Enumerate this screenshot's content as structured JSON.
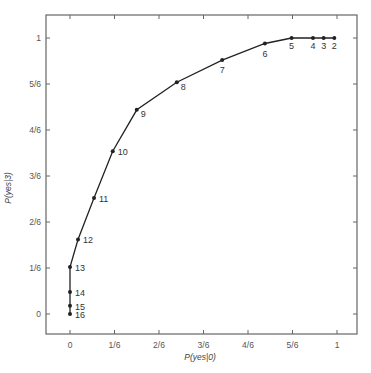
{
  "chart_data": {
    "type": "line",
    "title": "",
    "xlabel": "P(yes|0)",
    "ylabel": "P(yes|3)",
    "xlim": [
      -0.16,
      1.08
    ],
    "ylim": [
      -0.14,
      1.1
    ],
    "grid": false,
    "legend": null,
    "x_ticks": [
      {
        "value": 0,
        "label": "0"
      },
      {
        "value": 0.1667,
        "label": "1/6"
      },
      {
        "value": 0.3333,
        "label": "2/6"
      },
      {
        "value": 0.5,
        "label": "3/6"
      },
      {
        "value": 0.6667,
        "label": "4/6"
      },
      {
        "value": 0.8333,
        "label": "5/6"
      },
      {
        "value": 1,
        "label": "1"
      }
    ],
    "y_ticks": [
      {
        "value": 0,
        "label": "0"
      },
      {
        "value": 0.1667,
        "label": "1/6"
      },
      {
        "value": 0.3333,
        "label": "2/6"
      },
      {
        "value": 0.5,
        "label": "3/6"
      },
      {
        "value": 0.6667,
        "label": "4/6"
      },
      {
        "value": 0.8333,
        "label": "5/6"
      },
      {
        "value": 1,
        "label": "1"
      }
    ],
    "series": [
      {
        "name": "ROC",
        "points": [
          {
            "label": "2",
            "x": 0.99,
            "y": 1.0
          },
          {
            "label": "3",
            "x": 0.95,
            "y": 1.0
          },
          {
            "label": "4",
            "x": 0.91,
            "y": 1.0
          },
          {
            "label": "5",
            "x": 0.83,
            "y": 1.0
          },
          {
            "label": "6",
            "x": 0.73,
            "y": 0.98
          },
          {
            "label": "7",
            "x": 0.57,
            "y": 0.92
          },
          {
            "label": "8",
            "x": 0.4,
            "y": 0.84
          },
          {
            "label": "9",
            "x": 0.25,
            "y": 0.74
          },
          {
            "label": "10",
            "x": 0.16,
            "y": 0.59
          },
          {
            "label": "11",
            "x": 0.09,
            "y": 0.42
          },
          {
            "label": "12",
            "x": 0.03,
            "y": 0.27
          },
          {
            "label": "13",
            "x": 0.0,
            "y": 0.17
          },
          {
            "label": "14",
            "x": 0.0,
            "y": 0.08
          },
          {
            "label": "15",
            "x": 0.0,
            "y": 0.03
          },
          {
            "label": "16",
            "x": 0.0,
            "y": 0.0
          }
        ]
      }
    ]
  },
  "colors": {
    "line": "#222222",
    "frame": "#555555",
    "text": "#444444"
  }
}
